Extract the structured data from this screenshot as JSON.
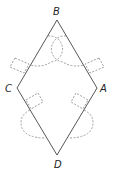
{
  "diagram": {
    "shape": "rhombus",
    "vertices": [
      {
        "name": "B",
        "x": 57,
        "y": 20,
        "label_x": 55,
        "label_y": 14
      },
      {
        "name": "A",
        "x": 97,
        "y": 88,
        "label_x": 99,
        "label_y": 92
      },
      {
        "name": "D",
        "x": 57,
        "y": 155,
        "label_x": 54,
        "label_y": 168
      },
      {
        "name": "C",
        "x": 17,
        "y": 88,
        "label_x": 5,
        "label_y": 92
      }
    ],
    "labels": {
      "B": "B",
      "A": "A",
      "D": "D",
      "C": "C"
    },
    "colors": {
      "edge": "#444444",
      "dashed": "#777777"
    }
  }
}
